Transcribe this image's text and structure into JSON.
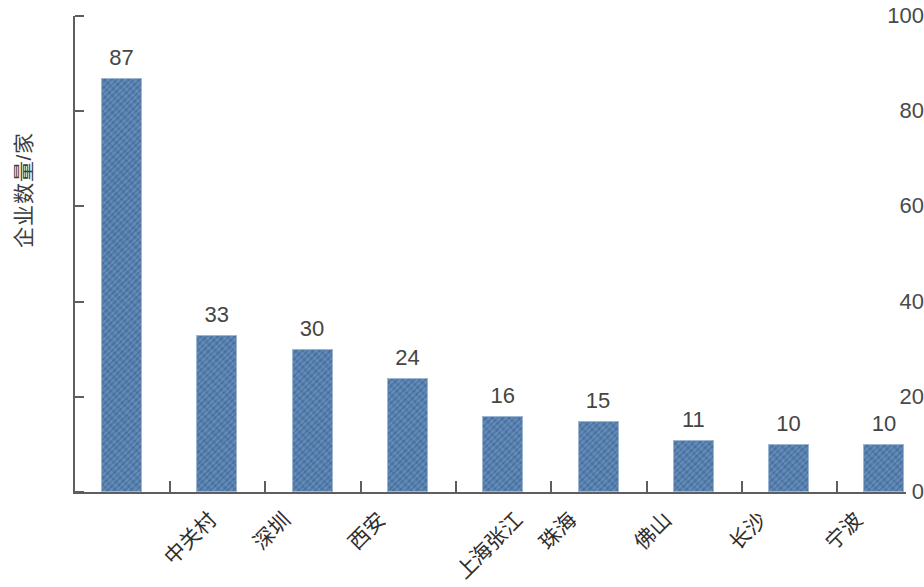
{
  "chart_data": {
    "type": "bar",
    "title": "",
    "subtitle": "",
    "xlabel": "",
    "ylabel": "企业数量/家",
    "categories": [
      "中关村",
      "深圳",
      "西安",
      "上海张江",
      "珠海",
      "佛山",
      "长沙",
      "宁波",
      "苏州工业园"
    ],
    "values": [
      87,
      33,
      30,
      24,
      16,
      15,
      11,
      10,
      10
    ],
    "value_labels": [
      "87",
      "33",
      "30",
      "24",
      "16",
      "15",
      "11",
      "10",
      "10"
    ],
    "ylim": [
      0,
      100
    ],
    "ytick_labels": [
      "0",
      "20",
      "40",
      "60",
      "80",
      "100"
    ],
    "ytick_values": [
      0,
      20,
      40,
      60,
      80,
      100
    ],
    "grid": false,
    "legend": null,
    "legend_position": "none",
    "series": [
      {
        "name": "企业数量",
        "values": [
          87,
          33,
          30,
          24,
          16,
          15,
          11,
          10,
          10
        ],
        "color": "#4f7cae"
      }
    ],
    "colors": {
      "bar_fill": "#4f7cae",
      "bar_border": "#9db6d2",
      "axis": "#5e5e5e",
      "text": "#3a3a3a",
      "background": "#ffffff"
    }
  }
}
